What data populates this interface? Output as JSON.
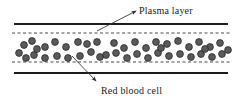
{
  "figure": {
    "background_color": "#ffffff",
    "width": 237,
    "height": 102
  },
  "labels": {
    "plasma_layer": "Plasma layer",
    "red_blood_cell": "Red blood cell"
  },
  "colors": {
    "wall_line": "#1c1c1c",
    "dashed_line": "#4a4a4a",
    "cell_fill": "#5a5a5a",
    "cell_stroke": "#2b2b2b",
    "leader_line": "#3a3a3a",
    "text": "#1a1a1a"
  },
  "vessel": {
    "wall_top_y": 24,
    "wall_bottom_y": 73,
    "wall_x_start": 14,
    "wall_x_end": 228,
    "wall_stroke_width": 2,
    "dashed_top_y": 33,
    "dashed_bottom_y": 62,
    "dashed_x_start": 12,
    "dashed_x_end": 230,
    "dash_pattern": "3,2.5",
    "dashed_stroke_width": 1
  },
  "annotations": {
    "plasma_leader": {
      "from_x": 97,
      "from_y": 31,
      "to_x": 136,
      "to_y": 11,
      "arrow_at": "end"
    },
    "rbc_leader": {
      "from_x": 72,
      "from_y": 56,
      "to_x": 96,
      "to_y": 81,
      "arrow_at": "end"
    }
  },
  "cells": {
    "radius": 3.4,
    "count": 44,
    "positions": [
      {
        "x": 19,
        "y": 53
      },
      {
        "x": 32,
        "y": 41
      },
      {
        "x": 34,
        "y": 55
      },
      {
        "x": 45,
        "y": 47
      },
      {
        "x": 45,
        "y": 58
      },
      {
        "x": 55,
        "y": 42
      },
      {
        "x": 57,
        "y": 56
      },
      {
        "x": 66,
        "y": 47
      },
      {
        "x": 68,
        "y": 58
      },
      {
        "x": 78,
        "y": 42
      },
      {
        "x": 80,
        "y": 56
      },
      {
        "x": 91,
        "y": 52
      },
      {
        "x": 97,
        "y": 42
      },
      {
        "x": 106,
        "y": 55
      },
      {
        "x": 114,
        "y": 43
      },
      {
        "x": 116,
        "y": 53
      },
      {
        "x": 124,
        "y": 48
      },
      {
        "x": 127,
        "y": 58
      },
      {
        "x": 135,
        "y": 42
      },
      {
        "x": 137,
        "y": 54
      },
      {
        "x": 146,
        "y": 48
      },
      {
        "x": 148,
        "y": 58
      },
      {
        "x": 156,
        "y": 42
      },
      {
        "x": 158,
        "y": 53
      },
      {
        "x": 167,
        "y": 44
      },
      {
        "x": 169,
        "y": 56
      },
      {
        "x": 178,
        "y": 41
      },
      {
        "x": 180,
        "y": 54
      },
      {
        "x": 189,
        "y": 47
      },
      {
        "x": 191,
        "y": 57
      },
      {
        "x": 199,
        "y": 42
      },
      {
        "x": 201,
        "y": 54
      },
      {
        "x": 210,
        "y": 47
      },
      {
        "x": 212,
        "y": 57
      },
      {
        "x": 220,
        "y": 43
      },
      {
        "x": 222,
        "y": 54
      },
      {
        "x": 24,
        "y": 45
      },
      {
        "x": 26,
        "y": 58
      },
      {
        "x": 37,
        "y": 49
      },
      {
        "x": 87,
        "y": 44
      },
      {
        "x": 100,
        "y": 57
      },
      {
        "x": 161,
        "y": 48
      },
      {
        "x": 205,
        "y": 49
      },
      {
        "x": 228,
        "y": 50
      }
    ]
  }
}
